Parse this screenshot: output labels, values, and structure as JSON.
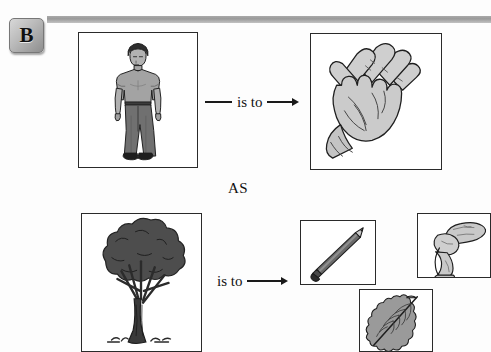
{
  "page": {
    "background_color": "#fdfdfd",
    "section_letter": "B",
    "rule_color": "#9a9a9a"
  },
  "analogy": {
    "relation_label": "is to",
    "as_label": "AS",
    "top_row": {
      "left_image": {
        "name": "person-standing",
        "alt": "Standing man in t-shirt and long pants"
      },
      "right_image": {
        "name": "open-hand",
        "alt": "Open human hand, palm facing forward"
      }
    },
    "bottom_row": {
      "left_image": {
        "name": "tree",
        "alt": "Broad leafy tree with thick trunk"
      },
      "options": [
        {
          "name": "pencil",
          "alt": "Sharpened pencil angled diagonally"
        },
        {
          "name": "bent-leg",
          "alt": "Human leg bent at the knee"
        },
        {
          "name": "leaf",
          "alt": "Serrated leaf with central vein"
        }
      ]
    }
  },
  "colors": {
    "ink": "#2a2a2a",
    "frame_border": "#2a2a2a",
    "figure_fill": "#9b9b9b",
    "figure_dark": "#5d5d5d",
    "figure_light": "#d6d6d6",
    "tree_foliage": "#4a4a4a",
    "badge_face": "#b9b9b9"
  }
}
